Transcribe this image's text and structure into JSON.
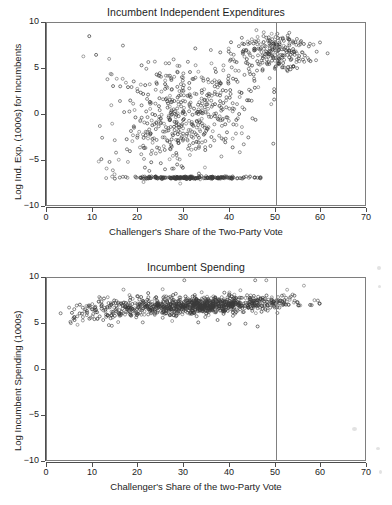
{
  "figure": {
    "width": 392,
    "height": 505,
    "background": "#ffffff",
    "axis_color": "#4d4d4d",
    "frame_color": "#7e7e7e",
    "marker_color": "#3a3a3a",
    "reference_line_color": "#808080"
  },
  "chart_data": [
    {
      "id": "incumbent-independent-expenditures",
      "type": "scatter",
      "title": "Incumbent Independent Expenditures",
      "xlabel": "Challenger's Share of the Two-Party Vote",
      "ylabel": "Log Ind. Exp. (1000s) for Incumbents",
      "xlim": [
        0,
        70
      ],
      "ylim": [
        -10,
        10
      ],
      "xticks": [
        0,
        10,
        20,
        30,
        40,
        50,
        60,
        70
      ],
      "yticks": [
        10,
        5,
        0,
        -5,
        -10
      ],
      "xtick_labels": [
        "0",
        "10",
        "20",
        "30",
        "40",
        "50",
        "60",
        "70"
      ],
      "ytick_labels": [
        "10",
        "5",
        "0",
        "−5",
        "−10"
      ],
      "grid": false,
      "legend": false,
      "marker": "open-circle",
      "marker_size": 3,
      "annotations": [
        {
          "type": "vertical-reference-line",
          "x": 50,
          "label": "50 percent vote share"
        }
      ],
      "n_points": 980,
      "point_clusters": [
        {
          "name": "floor-at-zero-spending",
          "n": 230,
          "x_mean": 31,
          "x_sd": 7.0,
          "x_min": 3,
          "x_max": 47,
          "y_mean": -7.0,
          "y_sd": 0.07
        },
        {
          "name": "main-diffuse-cloud",
          "n": 470,
          "x_mean": 31,
          "x_sd": 7.5,
          "x_min": 4,
          "x_max": 50,
          "y_mean": -0.4,
          "y_sd": 2.6
        },
        {
          "name": "upper-right-dense-band",
          "n": 230,
          "x_mean": 50,
          "x_sd": 4.2,
          "x_min": 40,
          "x_max": 63,
          "y_mean": 6.8,
          "y_sd": 1.0
        },
        {
          "name": "sparse-upper-left",
          "n": 50,
          "x_mean": 24,
          "x_sd": 8.0,
          "x_min": 8,
          "x_max": 45,
          "y_mean": 4.2,
          "y_sd": 1.6
        }
      ]
    },
    {
      "id": "incumbent-spending",
      "type": "scatter",
      "title": "Incumbent Spending",
      "xlabel": "Challenger's Share of the two-Party Vote",
      "ylabel": "Log Incumbent Spending (1000s)",
      "xlim": [
        0,
        70
      ],
      "ylim": [
        -10,
        10
      ],
      "xticks": [
        0,
        10,
        20,
        30,
        40,
        50,
        60,
        70
      ],
      "yticks": [
        10,
        5,
        0,
        -5,
        -10
      ],
      "xtick_labels": [
        "0",
        "10",
        "20",
        "30",
        "40",
        "50",
        "60",
        "70"
      ],
      "ytick_labels": [
        "10",
        "5",
        "0",
        "−5",
        "−10"
      ],
      "grid": false,
      "legend": false,
      "marker": "open-circle",
      "marker_size": 3,
      "annotations": [
        {
          "type": "vertical-reference-line",
          "x": 50,
          "label": "50 percent vote share"
        }
      ],
      "n_points": 1020,
      "point_clusters": [
        {
          "name": "main-horizontal-band",
          "n": 860,
          "x_mean": 34,
          "x_sd": 9.5,
          "x_min": 6,
          "x_max": 60,
          "y_mean": 7.0,
          "y_sd": 0.45
        },
        {
          "name": "left-tail-lower",
          "n": 110,
          "x_mean": 13,
          "x_sd": 4.5,
          "x_min": 3,
          "x_max": 24,
          "y_mean": 6.5,
          "y_sd": 0.7
        },
        {
          "name": "scattered-outliers",
          "n": 50,
          "x_mean": 33,
          "x_sd": 12.0,
          "x_min": 5,
          "x_max": 63,
          "y_mean": 7.4,
          "y_sd": 1.2
        }
      ]
    }
  ]
}
